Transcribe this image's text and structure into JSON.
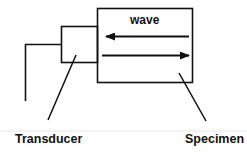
{
  "diagram": {
    "type": "ultrasonic-pulse-echo-schematic",
    "labels": {
      "wave": "wave",
      "transducer": "Transducer",
      "specimen": "Specimen"
    },
    "colors": {
      "stroke": "#111111",
      "background": "#ffffff",
      "divider": "#e6e6e6"
    },
    "shapes": {
      "specimen_box": {
        "x": 97,
        "y": 8,
        "width": 96,
        "height": 75
      },
      "transducer_box": {
        "x": 61,
        "y": 26,
        "width": 36,
        "height": 37
      },
      "wire": {
        "points": [
          [
            61,
            44
          ],
          [
            25,
            44
          ],
          [
            25,
            101
          ]
        ]
      },
      "arrow_reflected": {
        "from": [
          189,
          36
        ],
        "to": [
          106,
          36
        ],
        "direction": "left"
      },
      "arrow_incident": {
        "from": [
          102,
          55
        ],
        "to": [
          189,
          55
        ],
        "direction": "right"
      },
      "transducer_leader": {
        "from": [
          76,
          55
        ],
        "to": [
          48,
          120
        ]
      },
      "specimen_leader": {
        "from": [
          179,
          73
        ],
        "to": [
          206,
          121
        ]
      }
    }
  }
}
